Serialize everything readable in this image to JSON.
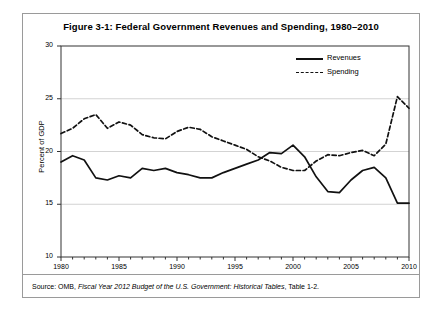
{
  "figure": {
    "title": "Figure 3-1: Federal Government Revenues and Spending, 1980–2010",
    "source_prefix": "Source: OMB, ",
    "source_italic": "Fiscal Year 2012 Budget of the U.S. Government: Historical Tables",
    "source_suffix": ", Table 1-2."
  },
  "legend": {
    "position": "top-right-inside",
    "items": [
      {
        "label": "Revenues",
        "style": "solid",
        "color": "#111111"
      },
      {
        "label": "Spending",
        "style": "dashed",
        "color": "#111111"
      }
    ]
  },
  "chart_data": {
    "type": "line",
    "title": "Figure 3-1: Federal Government Revenues and Spending, 1980–2010",
    "xlabel": "",
    "ylabel": "Percent of GDP",
    "xlim": [
      1980,
      2010
    ],
    "ylim": [
      10,
      30
    ],
    "yticks": [
      10,
      15,
      20,
      25,
      30
    ],
    "ytick_labels": [
      "10",
      "15",
      "20",
      "25",
      "30"
    ],
    "xticks": [
      1980,
      1985,
      1990,
      1995,
      2000,
      2005,
      2010
    ],
    "xtick_labels": [
      "1980",
      "1985",
      "1990",
      "1995",
      "2000",
      "2005",
      "2010"
    ],
    "xminor_step": 1,
    "grid": "horizontal-only",
    "x": [
      1980,
      1981,
      1982,
      1983,
      1984,
      1985,
      1986,
      1987,
      1988,
      1989,
      1990,
      1991,
      1992,
      1993,
      1994,
      1995,
      1996,
      1997,
      1998,
      1999,
      2000,
      2001,
      2002,
      2003,
      2004,
      2005,
      2006,
      2007,
      2008,
      2009,
      2010
    ],
    "series": [
      {
        "name": "Revenues",
        "style": "solid",
        "color": "#111111",
        "values": [
          19.0,
          19.6,
          19.2,
          17.5,
          17.3,
          17.7,
          17.5,
          18.4,
          18.2,
          18.4,
          18.0,
          17.8,
          17.5,
          17.5,
          18.0,
          18.4,
          18.8,
          19.2,
          19.9,
          19.8,
          20.6,
          19.5,
          17.6,
          16.2,
          16.1,
          17.3,
          18.2,
          18.5,
          17.5,
          15.1,
          15.1
        ]
      },
      {
        "name": "Spending",
        "style": "dashed",
        "color": "#111111",
        "values": [
          21.7,
          22.2,
          23.1,
          23.5,
          22.2,
          22.8,
          22.5,
          21.6,
          21.3,
          21.2,
          21.9,
          22.3,
          22.1,
          21.4,
          21.0,
          20.6,
          20.2,
          19.5,
          19.1,
          18.5,
          18.2,
          18.2,
          19.1,
          19.7,
          19.6,
          19.9,
          20.1,
          19.6,
          20.7,
          25.2,
          24.1
        ]
      }
    ]
  }
}
